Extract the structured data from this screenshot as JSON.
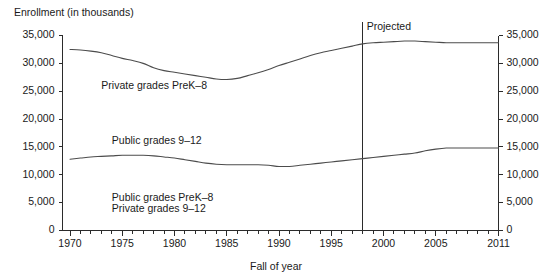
{
  "chart_data": {
    "type": "line",
    "title": "Enrollment (in thousands)",
    "xlabel": "Fall of year",
    "ylabel": "Enrollment (in thousands)",
    "xlim": [
      1969,
      2011
    ],
    "ylim": [
      0,
      35000
    ],
    "grid": false,
    "legend_position": "inline-labels",
    "y_ticks": [
      0,
      5000,
      10000,
      15000,
      20000,
      25000,
      30000,
      35000
    ],
    "y_tick_labels": [
      "0",
      "5,000",
      "10,000",
      "15,000",
      "20,000",
      "25,000",
      "30,000",
      "35,000"
    ],
    "y_axis_right_labels": [
      "0",
      "5,000",
      "10,000",
      "15,000",
      "20,000",
      "25,000",
      "30,000",
      "35,000"
    ],
    "x_ticks_major": [
      1970,
      1975,
      1980,
      1985,
      1990,
      1995,
      2000,
      2005,
      2011
    ],
    "x_tick_labels": [
      "1970",
      "1975",
      "1980",
      "1985",
      "1990",
      "1995",
      "2000",
      "2005",
      "2011"
    ],
    "x_minor_tick_interval": 1,
    "annotations": [
      {
        "text": "Projected",
        "x": 1998,
        "y": 34500,
        "name": "projected-annotation"
      }
    ],
    "projection_divider_year": 1998,
    "series": [
      {
        "name": "Public grades PreK-8",
        "inline_label": "Private grades PreK–8",
        "label_x": 1973,
        "label_y": 25400,
        "x": [
          1970,
          1971,
          1972,
          1973,
          1974,
          1975,
          1976,
          1977,
          1978,
          1979,
          1980,
          1981,
          1982,
          1983,
          1984,
          1985,
          1986,
          1987,
          1988,
          1989,
          1990,
          1991,
          1992,
          1993,
          1994,
          1995,
          1996,
          1997,
          1998,
          1999,
          2000,
          2001,
          2002,
          2003,
          2004,
          2005,
          2006,
          2007,
          2008,
          2009,
          2010,
          2011
        ],
        "values": [
          32500,
          32400,
          32200,
          31900,
          31400,
          30900,
          30500,
          30000,
          29200,
          28700,
          28400,
          28100,
          27800,
          27500,
          27200,
          27100,
          27300,
          27800,
          28300,
          28900,
          29600,
          30200,
          30800,
          31400,
          31900,
          32300,
          32700,
          33100,
          33500,
          33700,
          33800,
          33900,
          34000,
          34000,
          33900,
          33800,
          33700,
          33700,
          33700,
          33700,
          33700,
          33700
        ]
      },
      {
        "name": "Public grades 9-12",
        "inline_label": "Public grades 9–12",
        "label_x": 1974,
        "label_y": 15600,
        "x": [
          1970,
          1971,
          1972,
          1973,
          1974,
          1975,
          1976,
          1977,
          1978,
          1979,
          1980,
          1981,
          1982,
          1983,
          1984,
          1985,
          1986,
          1987,
          1988,
          1989,
          1990,
          1991,
          1992,
          1993,
          1994,
          1995,
          1996,
          1997,
          1998,
          1999,
          2000,
          2001,
          2002,
          2003,
          2004,
          2005,
          2006,
          2007,
          2008,
          2009,
          2010,
          2011
        ],
        "values": [
          12800,
          13000,
          13200,
          13300,
          13400,
          13500,
          13500,
          13500,
          13400,
          13200,
          13000,
          12700,
          12400,
          12100,
          11900,
          11800,
          11800,
          11800,
          11800,
          11700,
          11500,
          11500,
          11700,
          11900,
          12100,
          12300,
          12500,
          12700,
          12900,
          13100,
          13300,
          13500,
          13700,
          13900,
          14300,
          14600,
          14800,
          14800,
          14800,
          14800,
          14800,
          14800
        ]
      }
    ],
    "unlabeled_series_notes": [
      "Public grades PreK–8",
      "Private grades 9–12"
    ],
    "bottom_inline_labels": [
      {
        "text": "Public grades PreK–8",
        "x": 1974,
        "y": 5300
      },
      {
        "text": "Private grades 9–12",
        "x": 1974,
        "y": 3400
      }
    ],
    "colors": {
      "line": "#4c4c4c",
      "axis": "#2b2b2b",
      "text": "#1a1a1a",
      "background": "#ffffff"
    }
  }
}
